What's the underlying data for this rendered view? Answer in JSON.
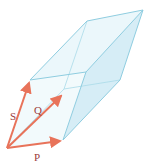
{
  "diagram": {
    "labels": {
      "s": "S",
      "q": "Q",
      "p": "P"
    },
    "colors": {
      "vector": "#e8735a",
      "edge": "#9fd3e6",
      "face": "#d6eef7",
      "label": "#9b3b3b"
    }
  }
}
